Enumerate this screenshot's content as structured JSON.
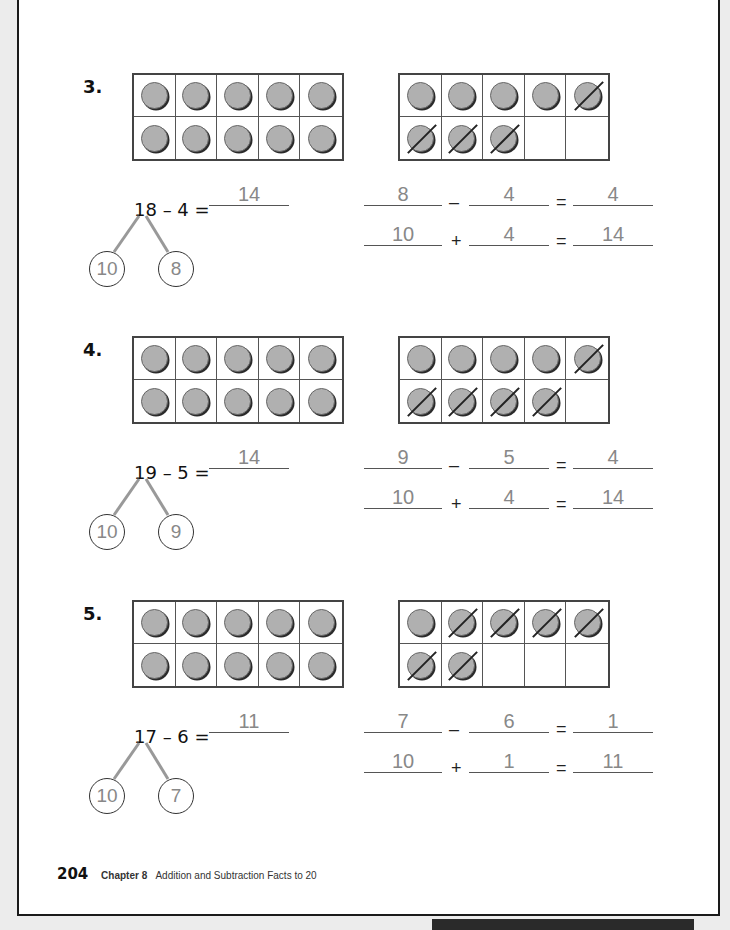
{
  "page": {
    "page_number": "204",
    "chapter_label": "Chapter 8",
    "chapter_title": "Addition and Subtraction Facts to 20"
  },
  "problems": [
    {
      "number": "3.",
      "left_frame": {
        "filled": 10,
        "crossed": 0
      },
      "right_frame": {
        "filled": 8,
        "crossed": 4
      },
      "main_equation": "18 – 4 =",
      "main_answer": "14",
      "bond": [
        "10",
        "8"
      ],
      "row1": {
        "a": "8",
        "op": "–",
        "b": "4",
        "eq": "=",
        "c": "4"
      },
      "row2": {
        "a": "10",
        "op": "+",
        "b": "4",
        "eq": "=",
        "c": "14"
      }
    },
    {
      "number": "4.",
      "left_frame": {
        "filled": 10,
        "crossed": 0
      },
      "right_frame": {
        "filled": 9,
        "crossed": 5
      },
      "main_equation": "19 – 5 =",
      "main_answer": "14",
      "bond": [
        "10",
        "9"
      ],
      "row1": {
        "a": "9",
        "op": "–",
        "b": "5",
        "eq": "=",
        "c": "4"
      },
      "row2": {
        "a": "10",
        "op": "+",
        "b": "4",
        "eq": "=",
        "c": "14"
      }
    },
    {
      "number": "5.",
      "left_frame": {
        "filled": 10,
        "crossed": 0
      },
      "right_frame": {
        "filled": 7,
        "crossed": 6
      },
      "main_equation": "17 – 6 =",
      "main_answer": "11",
      "bond": [
        "10",
        "7"
      ],
      "row1": {
        "a": "7",
        "op": "–",
        "b": "6",
        "eq": "=",
        "c": "1"
      },
      "row2": {
        "a": "10",
        "op": "+",
        "b": "1",
        "eq": "=",
        "c": "11"
      }
    }
  ]
}
